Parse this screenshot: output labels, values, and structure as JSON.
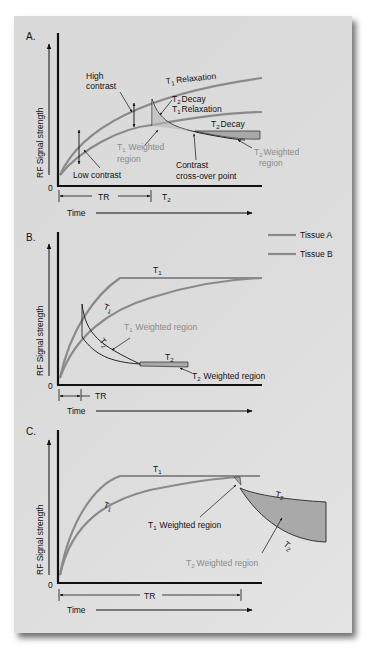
{
  "figure": {
    "colors": {
      "background": "#dadada",
      "curve": "#8a8a8a",
      "axis": "#111111",
      "shade": "#a9a9a9",
      "gray_label": "#8a8a8a"
    },
    "legend": {
      "items": [
        {
          "label": "Tissue A"
        },
        {
          "label": "Tissue B"
        }
      ]
    },
    "panels": [
      {
        "letter": "A.",
        "ylabel": "RF Signal strength",
        "origin": "0",
        "xlabel": "Time",
        "tr_label": "TR",
        "t2_axis_label": "T",
        "t2_axis_sub": "2",
        "labels": {
          "t1_relax_top": "Relaxation",
          "t2_decay_upper": "Decay",
          "t1_relax_mid": "Relaxation",
          "t2_decay_lower": "Decay",
          "high_contrast_1": "High",
          "high_contrast_2": "contrast",
          "low_contrast": "Low contrast",
          "t1_weighted_1": "Weighted",
          "t1_weighted_2": "region",
          "crossover_1": "Contrast",
          "crossover_2": "cross-over point",
          "t2_weighted_1": "Weighted",
          "t2_weighted_2": "region",
          "T": "T",
          "sub1": "1",
          "sub2": "2"
        }
      },
      {
        "letter": "B.",
        "ylabel": "RF Signal strength",
        "origin": "0",
        "xlabel": "Time",
        "tr_label": "TR",
        "labels": {
          "T": "T",
          "sub1": "1",
          "sub2": "2",
          "t1_weighted": "Weighted region",
          "t2_weighted": "Weighted region"
        }
      },
      {
        "letter": "C.",
        "ylabel": "RF Signal strength",
        "origin": "0",
        "xlabel": "Time",
        "tr_label": "TR",
        "labels": {
          "T": "T",
          "sub1": "1",
          "sub2": "2",
          "t1_weighted": "Weighted region",
          "t2_weighted": "Weighted region"
        }
      }
    ]
  }
}
